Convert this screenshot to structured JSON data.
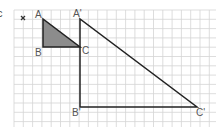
{
  "figure": {
    "part_label": "c",
    "center_mark": "×",
    "grid": {
      "x0": 14,
      "y0": 10,
      "x1": 216,
      "y1": 127,
      "cell": 9.3,
      "color": "#d4d4d4"
    },
    "colors": {
      "line": "#222222",
      "fill": "#8c8c8c"
    },
    "small_triangle": {
      "vertices": {
        "A": [
          43,
          19
        ],
        "B": [
          43,
          47
        ],
        "C": [
          80,
          47
        ]
      },
      "labels": {
        "A": "A",
        "B": "B",
        "C": "C"
      },
      "shaded": true
    },
    "large_triangle": {
      "vertices": {
        "A_prime": [
          80,
          19
        ],
        "B_prime": [
          80,
          107
        ],
        "C_prime": [
          197,
          107
        ]
      },
      "labels": {
        "A_prime": "A'",
        "B_prime": "B'",
        "C_prime": "C'"
      }
    }
  }
}
